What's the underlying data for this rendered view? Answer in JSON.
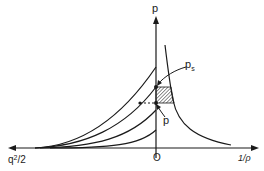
{
  "diagram": {
    "axes": {
      "vertical_label": "p",
      "horizontal_right_label": "1/ρ",
      "horizontal_left_label_base": "q",
      "horizontal_left_label_sup": "2",
      "horizontal_left_label_tail": "/2",
      "origin_label": "O"
    },
    "annotations": {
      "ps_label_base": "p",
      "ps_label_sub": "s",
      "p_label": "p"
    },
    "curves": {
      "family_count": 4,
      "family_description": "isentropic curves rising toward p-axis",
      "hyperbola_description": "p vs 1/ρ curve on right"
    },
    "colors": {
      "ink": "#1a1a1a",
      "background": "#ffffff",
      "hatch": "#555555"
    }
  }
}
